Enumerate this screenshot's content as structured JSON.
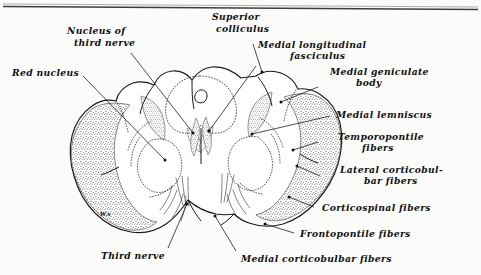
{
  "figure": {
    "background_color": "#fbfbf9",
    "ink_color": "#111111",
    "style": "pen-and-ink anatomical line drawing with stippled shading"
  },
  "labels": {
    "nucleus_of_third_nerve": {
      "line1": "Nucleus of",
      "line2": "third nerve"
    },
    "superior_colliculus": {
      "line1": "Superior",
      "line2": "colliculus"
    },
    "medial_longitudinal_fasciculus": {
      "line1": "Medial longitudinal",
      "line2": "fasciculus"
    },
    "medial_geniculate_body": {
      "line1": "Medial geniculate",
      "line2": "body"
    },
    "red_nucleus": {
      "line1": "Red nucleus"
    },
    "medial_lemniscus": {
      "line1": "Medial lemniscus"
    },
    "temporopontile_fibers": {
      "line1": "Temporopontile",
      "line2": "fibers"
    },
    "lateral_corticobulbar_fibers": {
      "line1": "Lateral corticobul-",
      "line2": "bar fibers"
    },
    "corticospinal_fibers": {
      "line1": "Corticospinal fibers"
    },
    "frontopontile_fibers": {
      "line1": "Frontopontile fibers"
    },
    "medial_corticobulbar_fibers": {
      "line1": "Medial corticobulbar fibers"
    },
    "third_nerve": {
      "line1": "Third nerve"
    },
    "initials_mark": {
      "line1": "W.s"
    }
  }
}
